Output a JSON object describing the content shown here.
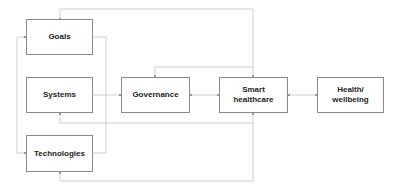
{
  "diagram": {
    "type": "flow",
    "nodes": [
      {
        "id": "goals",
        "label": "Goals"
      },
      {
        "id": "systems",
        "label": "Systems"
      },
      {
        "id": "technologies",
        "label": "Technologies"
      },
      {
        "id": "governance",
        "label": "Governance"
      },
      {
        "id": "smart_healthcare",
        "label": "Smart healthcare"
      },
      {
        "id": "health_wellbeing",
        "label": "Health/ wellbeing"
      }
    ],
    "edges": [
      {
        "from": "goals",
        "to": "governance"
      },
      {
        "from": "systems",
        "to": "governance"
      },
      {
        "from": "technologies",
        "to": "governance"
      },
      {
        "from": "governance",
        "to": "smart_healthcare",
        "bidirectional": true
      },
      {
        "from": "smart_healthcare",
        "to": "governance",
        "style": "feedback-top"
      },
      {
        "from": "smart_healthcare",
        "to": "health_wellbeing",
        "bidirectional": true
      },
      {
        "from": "smart_healthcare",
        "to": "goals",
        "style": "feedback-top"
      },
      {
        "from": "smart_healthcare",
        "to": "systems",
        "style": "feedback-bottom"
      },
      {
        "from": "smart_healthcare",
        "to": "technologies",
        "style": "feedback-bottom"
      }
    ],
    "colors": {
      "box_border": "#8a8a8a",
      "line": "#cfcfcf",
      "text": "#222222"
    }
  }
}
